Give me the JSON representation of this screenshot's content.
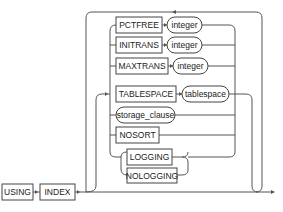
{
  "diagram": {
    "type": "railroad-syntax",
    "start_keywords": [
      {
        "label": "USING",
        "kind": "keyword"
      },
      {
        "label": "INDEX",
        "kind": "keyword"
      }
    ],
    "options": [
      {
        "keyword": "PCTFREE",
        "param": "integer"
      },
      {
        "keyword": "INITRANS",
        "param": "integer"
      },
      {
        "keyword": "MAXTRANS",
        "param": "integer"
      },
      {
        "keyword": "TABLESPACE",
        "param": "tablespace"
      },
      {
        "nonterminal": "storage_clause"
      },
      {
        "keyword": "NOSORT"
      },
      {
        "choice": [
          "LOGGING",
          "NOLOGGING"
        ]
      }
    ],
    "labels": {
      "using": "USING",
      "index": "INDEX",
      "pctfree": "PCTFREE",
      "initrans": "INITRANS",
      "maxtrans": "MAXTRANS",
      "tablespace_kw": "TABLESPACE",
      "integer": "integer",
      "tablespace": "tablespace",
      "storage_clause": "storage_clause",
      "nosort": "NOSORT",
      "logging": "LOGGING",
      "nologging": "NOLOGGING"
    },
    "colors": {
      "line": "#555555",
      "box_border": "#444444",
      "text": "#222222"
    }
  }
}
